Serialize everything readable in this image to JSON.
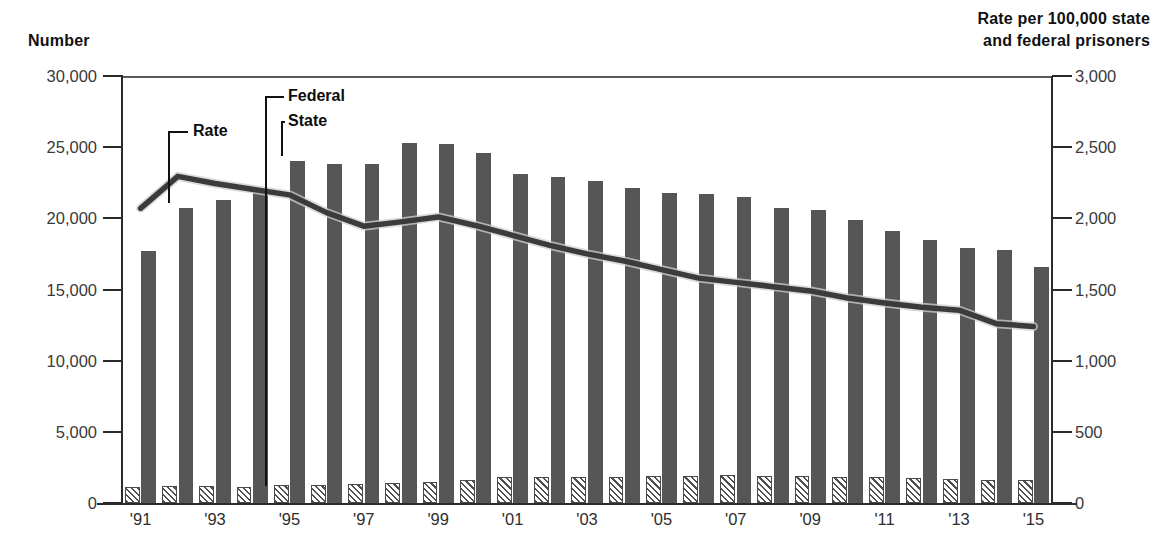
{
  "axes": {
    "left_title": "Number",
    "right_title": "Rate per 100,000 state\nand federal prisoners",
    "left_ticks": [
      "30,000",
      "25,000",
      "20,000",
      "15,000",
      "10,000",
      "5,000",
      "0"
    ],
    "right_ticks": [
      "3,000",
      "2,500",
      "2,000",
      "1,500",
      "1,000",
      "500",
      "0"
    ],
    "x_ticks": [
      "'91",
      "'93",
      "'95",
      "'97",
      "'99",
      "'01",
      "'03",
      "'05",
      "'07",
      "'09",
      "'11",
      "'13",
      "'15"
    ]
  },
  "callouts": {
    "rate": "Rate",
    "federal": "Federal",
    "state": "State"
  },
  "colors": {
    "state_bar": "#565656",
    "federal_bar": "#4f4f4f",
    "rate_line": "#3b3b3b",
    "axis": "#2b2b2b"
  },
  "chart_data": {
    "type": "bar",
    "title": "",
    "subtitle": "",
    "xlabel": "",
    "ylabel": "Number",
    "y2label": "Rate per 100,000 state and federal prisoners",
    "ylim": [
      0,
      30000
    ],
    "y2lim": [
      0,
      3000
    ],
    "grid": false,
    "legend_position": "callout-annotations",
    "categories": [
      "1991",
      "1992",
      "1993",
      "1994",
      "1995",
      "1996",
      "1997",
      "1998",
      "1999",
      "2000",
      "2001",
      "2002",
      "2003",
      "2004",
      "2005",
      "2006",
      "2007",
      "2008",
      "2009",
      "2010",
      "2011",
      "2012",
      "2013",
      "2014",
      "2015"
    ],
    "x_tick_labels": [
      "'91",
      "",
      "'93",
      "",
      "'95",
      "",
      "'97",
      "",
      "'99",
      "",
      "'01",
      "",
      "'03",
      "",
      "'05",
      "",
      "'07",
      "",
      "'09",
      "",
      "'11",
      "",
      "'13",
      "",
      "'15"
    ],
    "series": [
      {
        "name": "Federal",
        "axis": "left",
        "style": "hatched-bar",
        "values": [
          1100,
          1180,
          1200,
          1150,
          1250,
          1300,
          1350,
          1400,
          1450,
          1600,
          1850,
          1800,
          1800,
          1850,
          1900,
          1900,
          1950,
          1900,
          1900,
          1850,
          1800,
          1750,
          1700,
          1600,
          1600
        ]
      },
      {
        "name": "State",
        "axis": "left",
        "style": "solid-bar",
        "values": [
          17700,
          20700,
          21300,
          22000,
          24000,
          23800,
          23800,
          25300,
          25200,
          24600,
          23100,
          22900,
          22600,
          22100,
          21800,
          21700,
          21500,
          20700,
          20600,
          19900,
          19100,
          18500,
          17900,
          17800,
          16600
        ]
      },
      {
        "name": "Rate",
        "axis": "right",
        "style": "line",
        "values": [
          2070,
          2295,
          2245,
          2205,
          2165,
          2040,
          1945,
          1975,
          2010,
          1950,
          1880,
          1810,
          1750,
          1700,
          1640,
          1580,
          1550,
          1520,
          1490,
          1440,
          1405,
          1375,
          1355,
          1260,
          1240
        ]
      }
    ]
  }
}
